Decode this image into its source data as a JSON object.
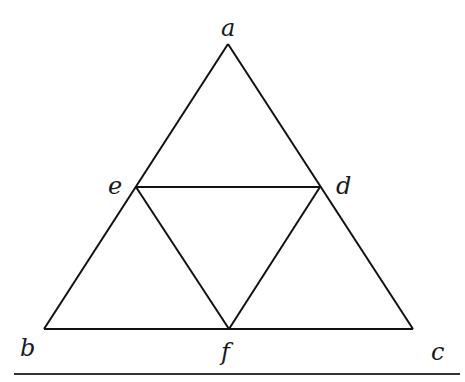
{
  "diagram": {
    "type": "subdivided-triangle",
    "points": {
      "a": {
        "label": "a",
        "x": 228,
        "y": 44
      },
      "b": {
        "label": "b",
        "x": 44,
        "y": 329
      },
      "c": {
        "label": "c",
        "x": 413,
        "y": 329
      },
      "d": {
        "label": "d",
        "x": 320,
        "y": 187
      },
      "e": {
        "label": "e",
        "x": 136,
        "y": 187
      },
      "f": {
        "label": "f",
        "x": 229,
        "y": 329
      }
    },
    "segments": [
      [
        "a",
        "b"
      ],
      [
        "a",
        "c"
      ],
      [
        "b",
        "c"
      ],
      [
        "e",
        "d"
      ],
      [
        "e",
        "f"
      ],
      [
        "d",
        "f"
      ]
    ],
    "line_color": "#111111",
    "label_color": "#1a1a1a"
  }
}
